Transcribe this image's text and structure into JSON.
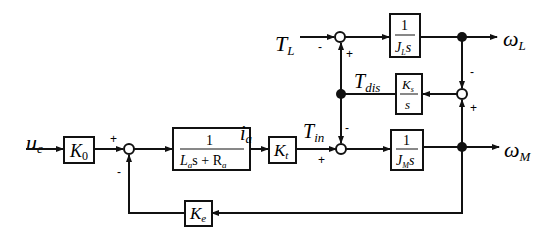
{
  "diagram": {
    "type": "block-diagram",
    "signals": {
      "input": "u",
      "input_sub": "c",
      "current": "i",
      "current_sub": "a",
      "torque_in": "T",
      "torque_in_sub": "in",
      "torque_dis": "T",
      "torque_dis_sub": "dis",
      "load_torque": "T",
      "load_torque_sub": "L",
      "omega_L": "ω",
      "omega_L_sub": "L",
      "omega_M": "ω",
      "omega_M_sub": "M"
    },
    "blocks": {
      "k0": {
        "main": "K",
        "sub": "0"
      },
      "electrical": {
        "numerator": "1",
        "den_a": "L",
        "den_a_sub": "a",
        "den_b": "s + R",
        "den_b_sub": "a"
      },
      "kt": {
        "main": "K",
        "sub": "t"
      },
      "load_inertia": {
        "numerator": "1",
        "den": "J",
        "den_sub": "L",
        "den_s": "s"
      },
      "spring": {
        "num": "K",
        "num_sub": "s",
        "den": "s"
      },
      "motor_inertia": {
        "numerator": "1",
        "den": "J",
        "den_sub": "M",
        "den_s": "s"
      },
      "ke": {
        "main": "K",
        "sub": "e"
      }
    },
    "signs": {
      "sum1_plus": "+",
      "sum1_minus": "-",
      "sum_motor_plus": "+",
      "sum_motor_minus": "-",
      "sum_load_minus": "-",
      "sum_load_plus": "+",
      "sum_spring_minus": "-",
      "sum_spring_plus": "+"
    }
  }
}
